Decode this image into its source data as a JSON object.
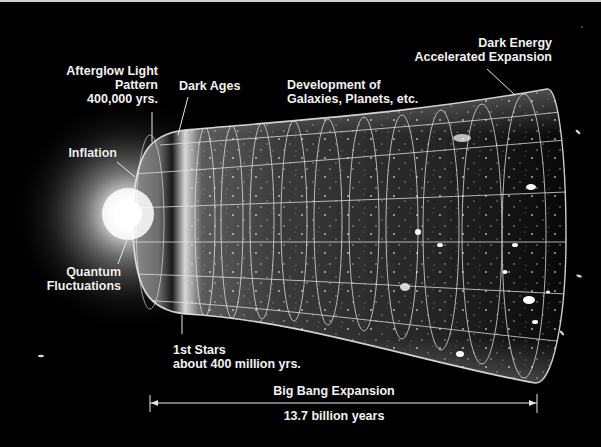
{
  "diagram": {
    "colors": {
      "background": "#000000",
      "text": "#f2f2f2",
      "grid": "#e6e6e6",
      "glow": "#ffffff"
    },
    "labels": {
      "afterglow": {
        "lines": [
          "Afterglow Light",
          "Pattern",
          "400,000 yrs."
        ]
      },
      "dark_ages": {
        "lines": [
          "Dark Ages"
        ]
      },
      "development": {
        "lines": [
          "Development of",
          "Galaxies, Planets, etc."
        ]
      },
      "dark_energy": {
        "lines": [
          "Dark Energy",
          "Accelerated Expansion"
        ]
      },
      "inflation": {
        "lines": [
          "Inflation"
        ]
      },
      "quantum": {
        "lines": [
          "Quantum",
          "Fluctuations"
        ]
      },
      "first_stars": {
        "lines": [
          "1st Stars",
          "about 400 million yrs."
        ]
      }
    },
    "timeline": {
      "caption": "Big Bang Expansion",
      "duration": "13.7 billion years"
    }
  }
}
